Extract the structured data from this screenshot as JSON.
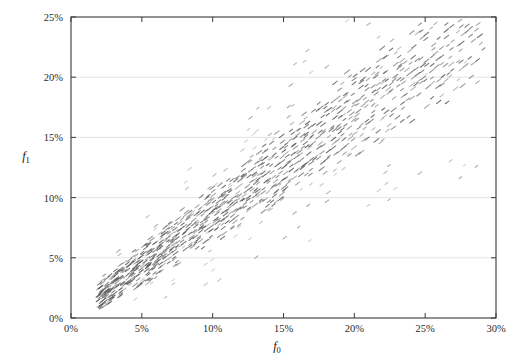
{
  "chart_data": {
    "type": "scatter",
    "title": "",
    "xlabel": "f0",
    "ylabel": "f1",
    "xlabel_base": "f",
    "xlabel_sub": "0",
    "ylabel_base": "f",
    "ylabel_sub": "1",
    "xlim": [
      0,
      30
    ],
    "ylim": [
      0,
      25
    ],
    "xticks": [
      0,
      5,
      10,
      15,
      20,
      25,
      30
    ],
    "yticks": [
      0,
      5,
      10,
      15,
      20,
      25
    ],
    "xticklabels": [
      "0%",
      "5%",
      "10%",
      "15%",
      "20%",
      "25%",
      "30%"
    ],
    "yticklabels": [
      "0%",
      "5%",
      "10%",
      "15%",
      "20%",
      "25%"
    ],
    "grid": "horizontal",
    "grid_color": "#d8d8d8",
    "axis_color": "#3a3a3a",
    "marker": "diagonal-streak",
    "marker_color": "#555555",
    "legend": null,
    "n_points": 1180,
    "trend_slope": 0.85,
    "trend_intercept": 0.1,
    "x_data_range": [
      2.0,
      29.0
    ],
    "y_data_range": [
      1.5,
      24.5
    ],
    "series": [
      {
        "name": "samples",
        "x": [
          2.1,
          2.4,
          2.6,
          2.9,
          3.1,
          3.4,
          3.6,
          3.9,
          4.1,
          4.4,
          4.6,
          4.9,
          5.1,
          5.4,
          5.6,
          5.9,
          6.1,
          6.4,
          6.6,
          6.9,
          7.1,
          7.4,
          7.6,
          7.9,
          8.1,
          8.4,
          8.6,
          8.9,
          9.1,
          9.4,
          9.6,
          9.9,
          10.2,
          10.6,
          11.0,
          11.4,
          11.8,
          12.2,
          12.6,
          13.0,
          13.5,
          14.0,
          14.5,
          15.0,
          15.6,
          16.2,
          16.8,
          17.4,
          18.0,
          18.7,
          19.4,
          20.1,
          20.8,
          21.6,
          22.4,
          23.2,
          24.0,
          25.0,
          26.0,
          27.0,
          28.0,
          29.0
        ],
        "y": [
          1.7,
          1.9,
          2.1,
          2.4,
          2.5,
          2.8,
          3.0,
          3.2,
          3.4,
          3.7,
          3.9,
          4.1,
          4.3,
          4.6,
          4.8,
          5.0,
          5.2,
          5.5,
          5.7,
          5.9,
          6.1,
          6.4,
          6.6,
          6.8,
          7.0,
          7.3,
          7.5,
          7.7,
          7.9,
          8.2,
          8.4,
          8.6,
          8.9,
          9.2,
          9.6,
          9.9,
          10.3,
          10.6,
          11.0,
          11.3,
          11.7,
          12.2,
          12.6,
          13.1,
          13.6,
          14.1,
          14.6,
          15.1,
          15.7,
          16.3,
          16.9,
          17.5,
          18.1,
          18.8,
          19.5,
          20.2,
          20.9,
          21.7,
          22.5,
          23.0,
          23.5,
          24.0
        ]
      }
    ]
  },
  "figure": {
    "background": "#ffffff",
    "plot_left_pct": 0,
    "plot_area": {
      "x": 71,
      "y": 17,
      "width": 425,
      "height": 301
    }
  }
}
